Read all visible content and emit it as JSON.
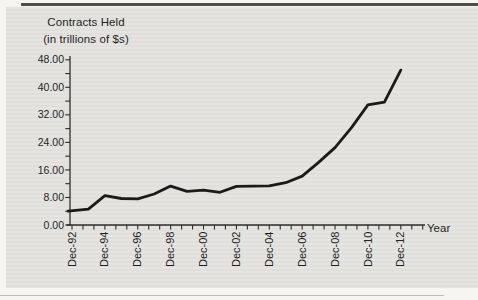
{
  "figure": {
    "kind": "scanned textbook line chart"
  },
  "chart_data": {
    "type": "line",
    "title": "Contracts Held",
    "subtitle": "(in trillions of $s)",
    "xlabel": "Year",
    "ylabel": "Contracts Held (in trillions of $s)",
    "ylim": [
      0,
      48
    ],
    "y_major_step": 8,
    "y_minor_step": 4,
    "x_tick_labels": [
      "Dec-92",
      "Dec-94",
      "Dec-96",
      "Dec-98",
      "Dec-00",
      "Dec-02",
      "Dec-04",
      "Dec-06",
      "Dec-08",
      "Dec-10",
      "Dec-12"
    ],
    "x_minor_ticks_per_label_interval": 3,
    "y_tick_labels": [
      "0.00",
      "8.00",
      "16.00",
      "24.00",
      "32.00",
      "40.00",
      "48.00"
    ],
    "grid": "off",
    "legend": "none",
    "x": [
      1992,
      1993,
      1994,
      1995,
      1996,
      1997,
      1998,
      1999,
      2000,
      2001,
      2002,
      2003,
      2004,
      2005,
      2006,
      2007,
      2008,
      2009,
      2010,
      2011,
      2012
    ],
    "series": [
      {
        "name": "Contracts held by commercial banks",
        "values": [
          4.0,
          4.6,
          8.5,
          7.7,
          7.6,
          9.0,
          11.3,
          9.8,
          10.1,
          9.5,
          11.2,
          11.3,
          11.4,
          12.3,
          14.2,
          18.2,
          22.5,
          28.3,
          34.9,
          35.7,
          45.0
        ]
      }
    ],
    "colors": {
      "line": "#1b1b1b",
      "axis": "#2e2d2b",
      "text": "#1f1f1f",
      "panel_bg": "#e4e3df",
      "top_rule": "#4e4d4b"
    }
  }
}
